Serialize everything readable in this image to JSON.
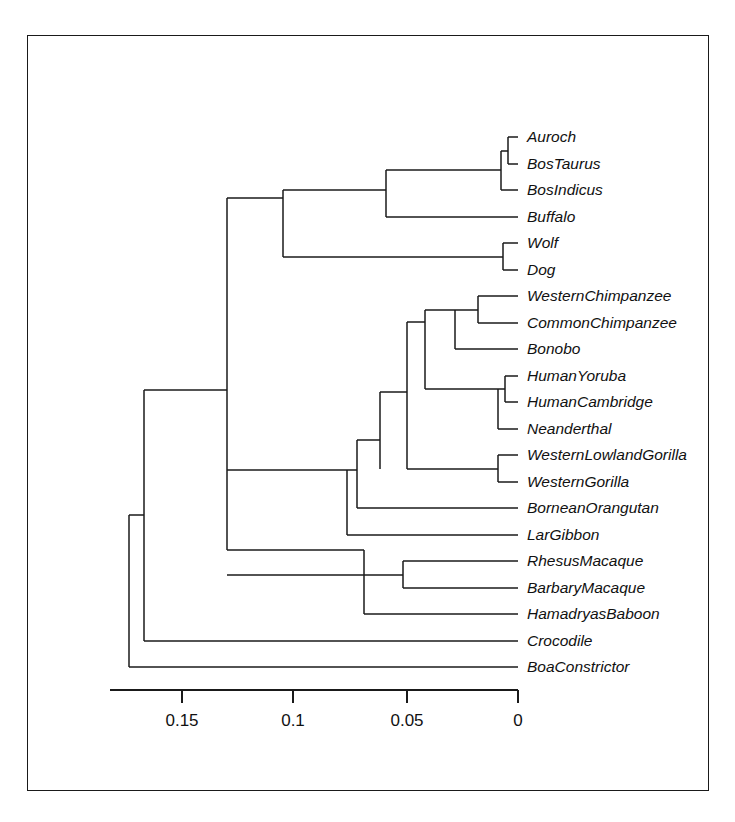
{
  "figure": {
    "type": "phylogenetic-tree",
    "title": "",
    "orientation": "right-to-left",
    "background_color": "#ffffff",
    "line_color": "#1a1a1a",
    "border": {
      "present": true,
      "color": "#1a1a1a"
    }
  },
  "chart_data": {
    "type": "tree",
    "title": "",
    "xlabel": "",
    "ylabel": "",
    "axis": {
      "orientation": "horizontal",
      "direction": "decreasing-left-to-right",
      "tick_labels": [
        "0.15",
        "0.1",
        "0.05",
        "0"
      ],
      "tick_values": [
        0.15,
        0.1,
        0.05,
        0
      ],
      "tick_x_px": [
        182,
        293,
        407,
        518
      ],
      "axis_line_x_px": [
        110,
        518
      ],
      "axis_y_px": 690,
      "grid": false,
      "legend": "none"
    },
    "leaf_count": 21,
    "leaves": [
      {
        "label": "Auroch",
        "y_px": 137,
        "tip_x_px": 518
      },
      {
        "label": "BosTaurus",
        "y_px": 164,
        "tip_x_px": 518
      },
      {
        "label": "BosIndicus",
        "y_px": 190,
        "tip_x_px": 518
      },
      {
        "label": "Buffalo",
        "y_px": 217,
        "tip_x_px": 518
      },
      {
        "label": "Wolf",
        "y_px": 243,
        "tip_x_px": 518
      },
      {
        "label": "Dog",
        "y_px": 270,
        "tip_x_px": 518
      },
      {
        "label": "WesternChimpanzee",
        "y_px": 296,
        "tip_x_px": 518
      },
      {
        "label": "CommonChimpanzee",
        "y_px": 323,
        "tip_x_px": 518
      },
      {
        "label": "Bonobo",
        "y_px": 349,
        "tip_x_px": 518
      },
      {
        "label": "HumanYoruba",
        "y_px": 376,
        "tip_x_px": 518
      },
      {
        "label": "HumanCambridge",
        "y_px": 402,
        "tip_x_px": 518
      },
      {
        "label": "Neanderthal",
        "y_px": 429,
        "tip_x_px": 518
      },
      {
        "label": "WesternLowlandGorilla",
        "y_px": 455,
        "tip_x_px": 518
      },
      {
        "label": "WesternGorilla",
        "y_px": 482,
        "tip_x_px": 518
      },
      {
        "label": "BorneanOrangutan",
        "y_px": 508,
        "tip_x_px": 518
      },
      {
        "label": "LarGibbon",
        "y_px": 535,
        "tip_x_px": 518
      },
      {
        "label": "RhesusMacaque",
        "y_px": 561,
        "tip_x_px": 518
      },
      {
        "label": "BarbaryMacaque",
        "y_px": 588,
        "tip_x_px": 518
      },
      {
        "label": "HamadryasBaboon",
        "y_px": 614,
        "tip_x_px": 518
      },
      {
        "label": "Crocodile",
        "y_px": 641,
        "tip_x_px": 518
      },
      {
        "label": "BoaConstrictor",
        "y_px": 667,
        "tip_x_px": 518
      }
    ],
    "internal_nodes": [
      {
        "name": "root",
        "x_px": 129,
        "y_top_px": 515,
        "y_bot_px": 667
      },
      {
        "name": "crocodile-split",
        "x_px": 144,
        "y_top_px": 390,
        "y_bot_px": 641
      },
      {
        "name": "mammals",
        "x_px": 227,
        "y_top_px": 198,
        "y_bot_px": 550
      },
      {
        "name": "laurasiatheria",
        "x_px": 283,
        "y_top_px": 190,
        "y_bot_px": 257
      },
      {
        "name": "bovidae",
        "x_px": 386,
        "y_top_px": 164,
        "y_bot_px": 217
      },
      {
        "name": "bos-clade",
        "x_px": 501,
        "y_top_px": 151,
        "y_bot_px": 190
      },
      {
        "name": "auroch-taurus",
        "x_px": 508,
        "y_top_px": 137,
        "y_bot_px": 164
      },
      {
        "name": "canidae",
        "x_px": 503,
        "y_top_px": 243,
        "y_bot_px": 270
      },
      {
        "name": "primates",
        "x_px": 347,
        "y_top_px": 470,
        "y_bot_px": 535
      },
      {
        "name": "hominoidea",
        "x_px": 357,
        "y_top_px": 440,
        "y_bot_px": 508
      },
      {
        "name": "hominidae",
        "x_px": 380,
        "y_top_px": 392,
        "y_bot_px": 469
      },
      {
        "name": "homininae",
        "x_px": 407,
        "y_top_px": 322,
        "y_bot_px": 402
      },
      {
        "name": "pan-homo",
        "x_px": 425,
        "y_top_px": 310,
        "y_bot_px": 389
      },
      {
        "name": "panini",
        "x_px": 455,
        "y_top_px": 310,
        "y_bot_px": 349
      },
      {
        "name": "chimpanzees",
        "x_px": 478,
        "y_top_px": 296,
        "y_bot_px": 323
      },
      {
        "name": "homo",
        "x_px": 498,
        "y_top_px": 389,
        "y_bot_px": 429
      },
      {
        "name": "human-pair",
        "x_px": 505,
        "y_top_px": 376,
        "y_bot_px": 402
      },
      {
        "name": "gorilla",
        "x_px": 498,
        "y_top_px": 455,
        "y_bot_px": 482
      },
      {
        "name": "cercopithecidae",
        "x_px": 364,
        "y_px_note": "monkeys",
        "y_top_px": 575,
        "y_bot_px": 614
      },
      {
        "name": "macaques",
        "x_px": 403,
        "y_top_px": 561,
        "y_bot_px": 588
      }
    ]
  }
}
